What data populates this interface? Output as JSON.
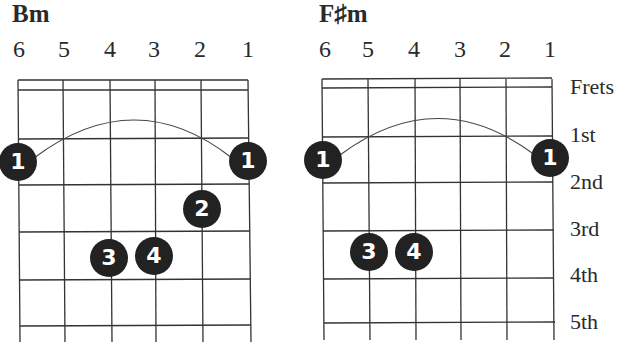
{
  "chords": [
    {
      "name": "Bm",
      "string_numbers": [
        "6",
        "5",
        "4",
        "3",
        "2",
        "1"
      ],
      "barre": {
        "finger": "1",
        "fret": 2,
        "from_string": 6,
        "to_string": 1
      },
      "fingers": [
        {
          "finger": "1",
          "string": 6,
          "fret": 2
        },
        {
          "finger": "1",
          "string": 1,
          "fret": 2
        },
        {
          "finger": "2",
          "string": 2,
          "fret": 3
        },
        {
          "finger": "3",
          "string": 4,
          "fret": 4
        },
        {
          "finger": "4",
          "string": 3,
          "fret": 4
        }
      ]
    },
    {
      "name": "F♯m",
      "string_numbers": [
        "6",
        "5",
        "4",
        "3",
        "2",
        "1"
      ],
      "barre": {
        "finger": "1",
        "fret": 2,
        "from_string": 6,
        "to_string": 1
      },
      "fingers": [
        {
          "finger": "1",
          "string": 6,
          "fret": 2
        },
        {
          "finger": "1",
          "string": 1,
          "fret": 2
        },
        {
          "finger": "3",
          "string": 5,
          "fret": 4
        },
        {
          "finger": "4",
          "string": 4,
          "fret": 4
        }
      ]
    }
  ],
  "fret_labels": [
    "Frets",
    "1st",
    "2nd",
    "3rd",
    "4th",
    "5th"
  ]
}
